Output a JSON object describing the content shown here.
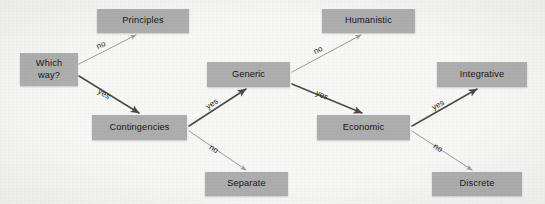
{
  "diagram": {
    "type": "decision-tree",
    "title": "",
    "background_color": "#f7f7f5",
    "node_fill_color": "#aeaeae",
    "yes_edge_color": "#4a4a4a",
    "no_edge_color": "#9b9b9b",
    "nodes": [
      {
        "id": "which-way",
        "label": "Which\nway?",
        "x": 20,
        "y": 53,
        "w": 58,
        "h": 33
      },
      {
        "id": "principles",
        "label": "Principles",
        "x": 97,
        "y": 9,
        "w": 92,
        "h": 24
      },
      {
        "id": "contingencies",
        "label": "Contingencies",
        "x": 92,
        "y": 115,
        "w": 95,
        "h": 25
      },
      {
        "id": "separate",
        "label": "Separate",
        "x": 205,
        "y": 172,
        "w": 83,
        "h": 24
      },
      {
        "id": "generic",
        "label": "Generic",
        "x": 207,
        "y": 62,
        "w": 83,
        "h": 25
      },
      {
        "id": "humanistic",
        "label": "Humanistic",
        "x": 322,
        "y": 9,
        "w": 93,
        "h": 24
      },
      {
        "id": "economic",
        "label": "Economic",
        "x": 317,
        "y": 115,
        "w": 93,
        "h": 25
      },
      {
        "id": "integrative",
        "label": "Integrative",
        "x": 437,
        "y": 62,
        "w": 90,
        "h": 25
      },
      {
        "id": "discrete",
        "label": "Discrete",
        "x": 432,
        "y": 172,
        "w": 90,
        "h": 24
      }
    ],
    "edges": [
      {
        "id": "which-way-to-principles",
        "from": "which-way",
        "to": "principles",
        "label": "no",
        "branch": "no",
        "x1": 79,
        "y1": 64,
        "x2": 136,
        "y2": 35,
        "label_x": 101,
        "label_y": 45,
        "label_rot": -27
      },
      {
        "id": "which-way-to-contingencies",
        "from": "which-way",
        "to": "contingencies",
        "label": "yes",
        "branch": "yes",
        "x1": 79,
        "y1": 76,
        "x2": 139,
        "y2": 113,
        "label_x": 104,
        "label_y": 94,
        "label_rot": 31
      },
      {
        "id": "contingencies-to-generic",
        "from": "contingencies",
        "to": "generic",
        "label": "yes",
        "branch": "yes",
        "x1": 189,
        "y1": 126,
        "x2": 246,
        "y2": 89,
        "label_x": 212,
        "label_y": 104,
        "label_rot": -33
      },
      {
        "id": "contingencies-to-separate",
        "from": "contingencies",
        "to": "separate",
        "label": "no",
        "branch": "no",
        "x1": 189,
        "y1": 131,
        "x2": 246,
        "y2": 170,
        "label_x": 214,
        "label_y": 149,
        "label_rot": 34
      },
      {
        "id": "generic-to-humanistic",
        "from": "generic",
        "to": "humanistic",
        "label": "no",
        "branch": "no",
        "x1": 292,
        "y1": 72,
        "x2": 361,
        "y2": 35,
        "label_x": 318,
        "label_y": 50,
        "label_rot": -28
      },
      {
        "id": "generic-to-economic",
        "from": "generic",
        "to": "economic",
        "label": "yes",
        "branch": "yes",
        "x1": 292,
        "y1": 84,
        "x2": 362,
        "y2": 113,
        "label_x": 322,
        "label_y": 95,
        "label_rot": 23
      },
      {
        "id": "economic-to-integrative",
        "from": "economic",
        "to": "integrative",
        "label": "yes",
        "branch": "yes",
        "x1": 412,
        "y1": 126,
        "x2": 477,
        "y2": 89,
        "label_x": 438,
        "label_y": 105,
        "label_rot": -30
      },
      {
        "id": "economic-to-discrete",
        "from": "economic",
        "to": "discrete",
        "label": "no",
        "branch": "no",
        "x1": 412,
        "y1": 131,
        "x2": 472,
        "y2": 170,
        "label_x": 438,
        "label_y": 148,
        "label_rot": 33
      }
    ]
  }
}
